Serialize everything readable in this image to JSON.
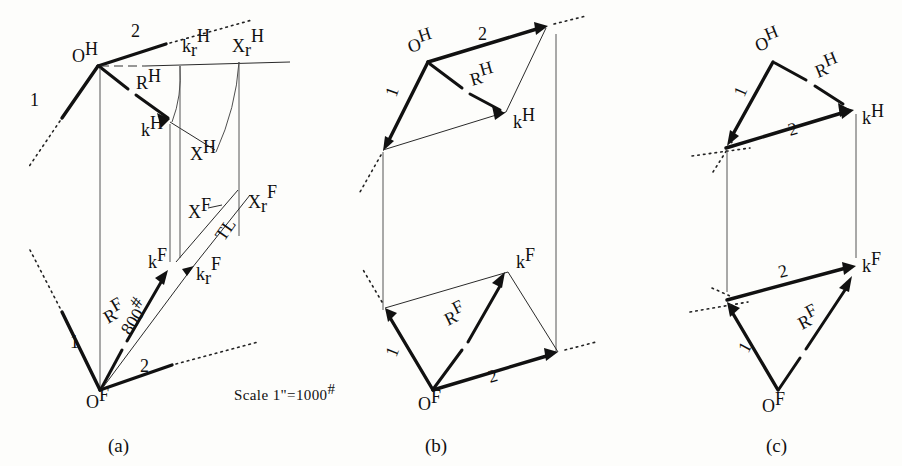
{
  "figure": {
    "scale_note": "Scale 1\"=1000",
    "scale_note_sup": "#",
    "captions": [
      "(a)",
      "(b)",
      "(c)"
    ]
  },
  "diagram_a": {
    "id": "a",
    "caption": "(a)",
    "top_view": {
      "origin_label": "O",
      "origin_sup": "H",
      "member_1": "1",
      "member_2": "2",
      "resultant": "R",
      "resultant_sup": "H",
      "k_point": "k",
      "k_sup": "H",
      "kr_point": "k",
      "kr_sub": "r",
      "kr_sup": "H",
      "xr_point": "X",
      "xr_sub": "r",
      "xr_sup": "H",
      "x_h": "X",
      "x_h_sup": "H"
    },
    "front_view": {
      "origin_label": "O",
      "origin_sup": "F",
      "member_1": "1",
      "member_2": "2",
      "resultant": "R",
      "resultant_sup": "F",
      "magnitude": "800",
      "magnitude_sup": "#",
      "k_point": "k",
      "k_sup": "F",
      "kr_point": "k",
      "kr_sub": "r",
      "kr_sup": "F",
      "x_f": "X",
      "x_f_sup": "F",
      "xr_point": "X",
      "xr_sub": "r",
      "xr_sup": "F",
      "true_length": "TL"
    }
  },
  "diagram_b": {
    "id": "b",
    "caption": "(b)",
    "top_view": {
      "origin_label": "O",
      "origin_sup": "H",
      "member_1": "1",
      "member_2": "2",
      "resultant": "R",
      "resultant_sup": "H",
      "k_point": "k",
      "k_sup": "H"
    },
    "front_view": {
      "origin_label": "O",
      "origin_sup": "F",
      "member_1": "1",
      "member_2": "2",
      "resultant": "R",
      "resultant_sup": "F",
      "k_point": "k",
      "k_sup": "F"
    }
  },
  "diagram_c": {
    "id": "c",
    "caption": "(c)",
    "top_view": {
      "origin_label": "O",
      "origin_sup": "H",
      "member_1": "1",
      "member_2": "2",
      "resultant": "R",
      "resultant_sup": "H",
      "k_point": "k",
      "k_sup": "H"
    },
    "front_view": {
      "origin_label": "O",
      "origin_sup": "F",
      "member_1": "1",
      "member_2": "2",
      "resultant": "R",
      "resultant_sup": "F",
      "k_point": "k",
      "k_sup": "F"
    }
  },
  "colors": {
    "ink": "#111111",
    "paper": "#fdfdfb",
    "light_ink": "#555555"
  }
}
